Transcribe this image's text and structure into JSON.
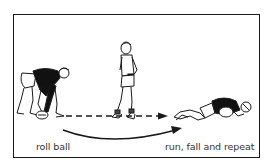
{
  "diagram": {
    "labels": {
      "start": "roll ball",
      "end": "run, fall and repeat"
    },
    "figures": [
      {
        "id": "roller",
        "pose": "crouching, rolling ball"
      },
      {
        "id": "runner",
        "pose": "standing, ready to run"
      },
      {
        "id": "faller",
        "pose": "lying on ground, falling on ball"
      }
    ],
    "arrows": [
      {
        "id": "ball-path",
        "style": "dashed",
        "from": "roller",
        "to": "faller"
      },
      {
        "id": "runner-path",
        "style": "curved solid",
        "from": "roller",
        "to": "faller"
      }
    ],
    "colors": {
      "ink": "#1a1a1a",
      "paper": "#ffffff"
    }
  }
}
